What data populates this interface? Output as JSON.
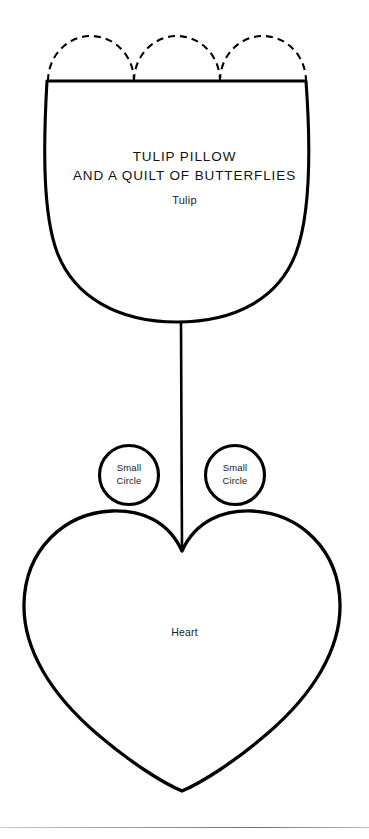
{
  "document": {
    "title_line_1": "TULIP PILLOW",
    "title_line_2": "AND A QUILT OF BUTTERFLIES",
    "tulip_label": "Tulip",
    "heart_label": "Heart"
  },
  "pieces": {
    "tulip": {
      "label": "Tulip"
    },
    "small_circle_left": {
      "line_1": "Small",
      "line_2": "Circle"
    },
    "small_circle_right": {
      "line_1": "Small",
      "line_2": "Circle"
    },
    "heart": {
      "label": "Heart"
    }
  },
  "style": {
    "ink": "#000000",
    "paper": "#ffffff",
    "rule": "#8f8f8f"
  }
}
